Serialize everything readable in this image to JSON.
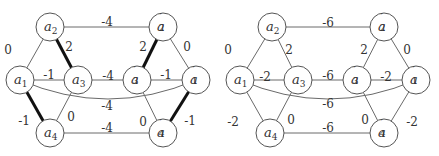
{
  "graphs": [
    {
      "id": "left",
      "nodes": [
        {
          "id": "a1",
          "base": "a",
          "sub": "1",
          "prime": false,
          "x": 20,
          "y": 80
        },
        {
          "id": "a2",
          "base": "a",
          "sub": "2",
          "prime": false,
          "x": 50,
          "y": 27
        },
        {
          "id": "a3",
          "base": "a",
          "sub": "3",
          "prime": false,
          "x": 78,
          "y": 80
        },
        {
          "id": "a4",
          "base": "a",
          "sub": "4",
          "prime": false,
          "x": 50,
          "y": 133
        },
        {
          "id": "a1p",
          "base": "a",
          "sub": "1",
          "prime": true,
          "x": 196,
          "y": 80
        },
        {
          "id": "a2p",
          "base": "a",
          "sub": "2",
          "prime": true,
          "x": 163,
          "y": 27
        },
        {
          "id": "a3p",
          "base": "a",
          "sub": "3",
          "prime": true,
          "x": 137,
          "y": 80
        },
        {
          "id": "a4p",
          "base": "a",
          "sub": "4",
          "prime": true,
          "x": 163,
          "y": 133
        }
      ],
      "edges": [
        {
          "from": "a1",
          "to": "a2",
          "weight": "0",
          "bold": false,
          "lx": 8,
          "ly": 50
        },
        {
          "from": "a2",
          "to": "a3",
          "weight": "2",
          "bold": true,
          "lx": 69,
          "ly": 47
        },
        {
          "from": "a1",
          "to": "a3",
          "weight": "-1",
          "bold": false,
          "lx": 49,
          "ly": 75
        },
        {
          "from": "a1",
          "to": "a4",
          "weight": "-1",
          "bold": true,
          "lx": 24,
          "ly": 121
        },
        {
          "from": "a3",
          "to": "a4",
          "weight": "0",
          "bold": false,
          "lx": 71,
          "ly": 117
        },
        {
          "from": "a2",
          "to": "a2p",
          "weight": "-4",
          "bold": false,
          "lx": 107,
          "ly": 22
        },
        {
          "from": "a3",
          "to": "a3p",
          "weight": "-4",
          "bold": false,
          "lx": 108,
          "ly": 76
        },
        {
          "from": "a4",
          "to": "a4p",
          "weight": "-4",
          "bold": false,
          "lx": 107,
          "ly": 128
        },
        {
          "from": "a1",
          "to": "a1p",
          "weight": "-4",
          "bold": false,
          "curve": true,
          "lx": 107,
          "ly": 106
        },
        {
          "from": "a2p",
          "to": "a3p",
          "weight": "2",
          "bold": true,
          "lx": 143,
          "ly": 47
        },
        {
          "from": "a2p",
          "to": "a1p",
          "weight": "0",
          "bold": false,
          "lx": 187,
          "ly": 47
        },
        {
          "from": "a3p",
          "to": "a1p",
          "weight": "-1",
          "bold": false,
          "lx": 166,
          "ly": 75
        },
        {
          "from": "a3p",
          "to": "a4p",
          "weight": "0",
          "bold": false,
          "lx": 143,
          "ly": 122
        },
        {
          "from": "a1p",
          "to": "a4p",
          "weight": "-1",
          "bold": true,
          "lx": 190,
          "ly": 121
        }
      ]
    },
    {
      "id": "right",
      "nodes": [
        {
          "id": "a1",
          "base": "a",
          "sub": "1",
          "prime": false,
          "x": 240,
          "y": 80
        },
        {
          "id": "a2",
          "base": "a",
          "sub": "2",
          "prime": false,
          "x": 272,
          "y": 27
        },
        {
          "id": "a3",
          "base": "a",
          "sub": "3",
          "prime": false,
          "x": 298,
          "y": 80
        },
        {
          "id": "a4",
          "base": "a",
          "sub": "4",
          "prime": false,
          "x": 270,
          "y": 133
        },
        {
          "id": "a1p",
          "base": "a",
          "sub": "1",
          "prime": true,
          "x": 416,
          "y": 80
        },
        {
          "id": "a2p",
          "base": "a",
          "sub": "2",
          "prime": true,
          "x": 384,
          "y": 27
        },
        {
          "id": "a3p",
          "base": "a",
          "sub": "3",
          "prime": true,
          "x": 357,
          "y": 80
        },
        {
          "id": "a4p",
          "base": "a",
          "sub": "4",
          "prime": true,
          "x": 384,
          "y": 133
        }
      ],
      "edges": [
        {
          "from": "a1",
          "to": "a2",
          "weight": "0",
          "bold": false,
          "lx": 228,
          "ly": 50
        },
        {
          "from": "a2",
          "to": "a3",
          "weight": "2",
          "bold": false,
          "lx": 289,
          "ly": 50
        },
        {
          "from": "a1",
          "to": "a3",
          "weight": "-2",
          "bold": false,
          "lx": 265,
          "ly": 77
        },
        {
          "from": "a1",
          "to": "a4",
          "weight": "-2",
          "bold": false,
          "lx": 233,
          "ly": 122
        },
        {
          "from": "a3",
          "to": "a4",
          "weight": "0",
          "bold": false,
          "lx": 291,
          "ly": 120
        },
        {
          "from": "a2",
          "to": "a2p",
          "weight": "-6",
          "bold": false,
          "lx": 328,
          "ly": 23
        },
        {
          "from": "a3",
          "to": "a3p",
          "weight": "-6",
          "bold": false,
          "lx": 328,
          "ly": 76
        },
        {
          "from": "a4",
          "to": "a4p",
          "weight": "-6",
          "bold": false,
          "lx": 328,
          "ly": 128
        },
        {
          "from": "a1",
          "to": "a1p",
          "weight": "-6",
          "bold": false,
          "curve": true,
          "lx": 328,
          "ly": 104
        },
        {
          "from": "a2p",
          "to": "a3p",
          "weight": "2",
          "bold": false,
          "lx": 364,
          "ly": 50
        },
        {
          "from": "a2p",
          "to": "a1p",
          "weight": "0",
          "bold": false,
          "lx": 407,
          "ly": 50
        },
        {
          "from": "a3p",
          "to": "a1p",
          "weight": "-2",
          "bold": false,
          "lx": 386,
          "ly": 77
        },
        {
          "from": "a3p",
          "to": "a4p",
          "weight": "0",
          "bold": false,
          "lx": 365,
          "ly": 120
        },
        {
          "from": "a1p",
          "to": "a4p",
          "weight": "-2",
          "bold": false,
          "lx": 412,
          "ly": 122
        }
      ]
    }
  ],
  "node_radius": 14
}
